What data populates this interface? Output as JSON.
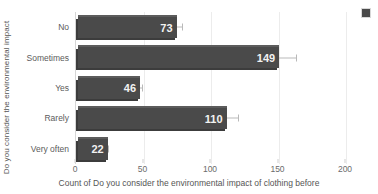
{
  "chart_data": {
    "type": "bar",
    "orientation": "horizontal",
    "title": "",
    "categories": [
      "No",
      "Sometimes",
      "Yes",
      "Rarely",
      "Very often"
    ],
    "values": [
      73,
      149,
      46,
      110,
      22
    ],
    "error_upper": [
      8,
      16,
      5,
      12,
      4
    ],
    "xlabel": "Count of Do you consider the environmental impact of clothing before",
    "ylabel": "Do you consider the environmental impact",
    "xlim": [
      0,
      200
    ],
    "xticks": [
      0,
      50,
      100,
      150,
      200
    ],
    "xtick_labels": [
      "0",
      "50",
      "100",
      "150",
      "200"
    ],
    "grid": "vertical",
    "legend_position": "top-right",
    "bar_color": "#4a4a4a",
    "error_bar_color": "#b9b9b9",
    "grid_color": "#ececec"
  },
  "axis": {
    "y_title": "Do you consider the environmental impact",
    "x_title": "Count of Do you consider the environmental impact of clothing before"
  },
  "legend": {
    "swatch_color": "#4a4a4a"
  }
}
